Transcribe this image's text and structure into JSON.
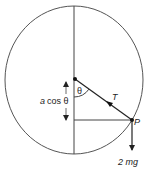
{
  "diagram": {
    "labels": {
      "theta": "θ",
      "tension": "T",
      "point": "P",
      "weight": "2 mg",
      "height_a": "a",
      "height_cos": "cos θ"
    },
    "colors": {
      "stroke": "#444444",
      "text": "#222222",
      "background": "#ffffff"
    }
  }
}
